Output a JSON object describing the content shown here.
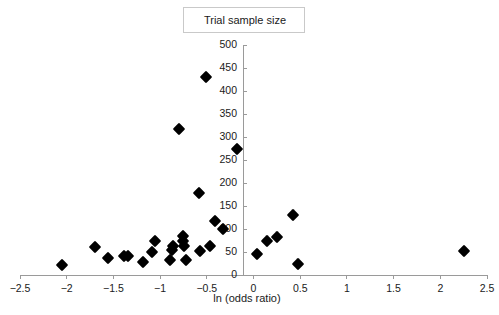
{
  "legend": {
    "label": "Trial sample size"
  },
  "chart_data": {
    "type": "scatter",
    "title": "",
    "xlabel": "ln (odds ratio)",
    "ylabel": "",
    "legend_entries": [
      "Trial sample size"
    ],
    "legend_position": "top-center",
    "grid": false,
    "xlim": [
      -2.5,
      2.5
    ],
    "ylim": [
      0,
      500
    ],
    "xticks": [
      -2.5,
      -2,
      -1.5,
      -1,
      -0.5,
      0,
      0.5,
      1,
      1.5,
      2,
      2.5
    ],
    "xtick_labels": [
      "−2.5",
      "−2",
      "−1.5",
      "−1",
      "−0.5",
      "0",
      "0.5",
      "1",
      "1.5",
      "2",
      "2.5"
    ],
    "yticks": [
      0,
      50,
      100,
      150,
      200,
      250,
      300,
      350,
      400,
      450,
      500
    ],
    "ytick_labels": [
      "0",
      "50",
      "100",
      "150",
      "200",
      "250",
      "300",
      "350",
      "400",
      "450",
      "500"
    ],
    "marker": "diamond",
    "marker_color": "#000000",
    "points": [
      {
        "x": -2.05,
        "y": 22
      },
      {
        "x": -1.7,
        "y": 60
      },
      {
        "x": -1.56,
        "y": 38
      },
      {
        "x": -1.39,
        "y": 42
      },
      {
        "x": -1.34,
        "y": 42
      },
      {
        "x": -1.18,
        "y": 28
      },
      {
        "x": -1.09,
        "y": 50
      },
      {
        "x": -1.05,
        "y": 75
      },
      {
        "x": -0.89,
        "y": 33
      },
      {
        "x": -0.87,
        "y": 55
      },
      {
        "x": -0.86,
        "y": 64
      },
      {
        "x": -0.8,
        "y": 318
      },
      {
        "x": -0.76,
        "y": 85
      },
      {
        "x": -0.75,
        "y": 74
      },
      {
        "x": -0.74,
        "y": 63
      },
      {
        "x": -0.72,
        "y": 33
      },
      {
        "x": -0.58,
        "y": 178
      },
      {
        "x": -0.57,
        "y": 53
      },
      {
        "x": -0.51,
        "y": 430
      },
      {
        "x": -0.47,
        "y": 62
      },
      {
        "x": -0.41,
        "y": 117
      },
      {
        "x": -0.33,
        "y": 101
      },
      {
        "x": -0.18,
        "y": 274
      },
      {
        "x": 0.04,
        "y": 45
      },
      {
        "x": 0.14,
        "y": 75
      },
      {
        "x": 0.25,
        "y": 82
      },
      {
        "x": 0.42,
        "y": 131
      },
      {
        "x": 0.48,
        "y": 25
      },
      {
        "x": 2.25,
        "y": 52
      }
    ]
  }
}
